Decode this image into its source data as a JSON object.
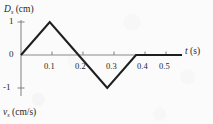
{
  "figure": {
    "name": "displacement-vs-time-triangular-wave",
    "background_color": "#fbfbfb",
    "curve_color": "#1a1a1a",
    "axis_color": "#7a7a7a"
  },
  "labels": {
    "y_axis_symbol": "D",
    "y_axis_subscript": "s",
    "y_axis_unit": "(cm)",
    "x_axis_symbol": "t",
    "x_axis_unit": "(s)",
    "lower_axis_symbol": "v",
    "lower_axis_subscript": "s",
    "lower_axis_unit": "(cm/s)"
  },
  "chart_data": {
    "type": "line",
    "title": "",
    "xlabel": "t (s)",
    "ylabel": "D_s (cm)",
    "xlim": [
      0,
      0.56
    ],
    "ylim": [
      -1.35,
      1.35
    ],
    "grid": false,
    "legend": null,
    "xticks": [
      0.1,
      0.2,
      0.3,
      0.4,
      0.5
    ],
    "xtick_labels": [
      "0.1",
      "0.2",
      "0.3",
      "0.4",
      "0.5"
    ],
    "yticks": [
      -1,
      0,
      1
    ],
    "ytick_labels": [
      "-1",
      "0",
      "1"
    ],
    "series": [
      {
        "name": "D_s",
        "x": [
          0.0,
          0.1,
          0.2,
          0.3,
          0.4,
          0.56
        ],
        "y": [
          0,
          1,
          0,
          -1,
          0,
          0
        ],
        "description": "Triangular pulse: rises linearly from 0 to +1 cm at t=0.1 s, falls linearly to -1 cm at t=0.3 s, returns to 0 at t=0.4 s, then stays at 0."
      }
    ]
  }
}
